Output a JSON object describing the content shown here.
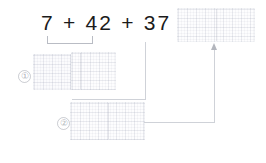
{
  "worksheet": {
    "equation": "7 + 42 + 37 =",
    "equation_terms": [
      "7",
      "42",
      "37"
    ],
    "operators": [
      "+",
      "+"
    ],
    "equals_sign": "=",
    "ink_color": "#1b1b1b",
    "connector_color": "#cfd2d8",
    "bracket_color": "#b9bcc4",
    "grid_line_color": "#969baf",
    "background_color": "#ffffff"
  },
  "steps": [
    {
      "marker": "①",
      "label": "step-one"
    },
    {
      "marker": "②",
      "label": "step-two"
    }
  ],
  "answer_boxes": [
    {
      "name": "final-answer-box",
      "value": ""
    },
    {
      "name": "step-one-box-left",
      "value": ""
    },
    {
      "name": "step-one-box-right",
      "value": ""
    },
    {
      "name": "step-two-box",
      "value": ""
    }
  ]
}
